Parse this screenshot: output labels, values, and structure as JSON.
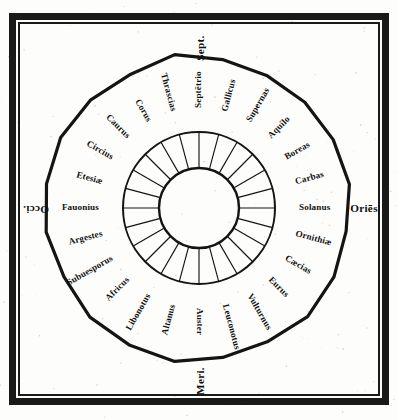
{
  "figure": {
    "ink_color": "#141414",
    "paper_color": "#fdfdfb"
  },
  "cardinals": [
    {
      "label": "Sept.",
      "name": "north",
      "position": "top",
      "rotation": -90
    },
    {
      "label": "Oriēs",
      "name": "east",
      "position": "right",
      "rotation": 0
    },
    {
      "label": "Meri.",
      "name": "south",
      "position": "bottom",
      "rotation": -90
    },
    {
      "label": "Occi.",
      "name": "west",
      "position": "left",
      "rotation": 180
    }
  ],
  "winds": [
    {
      "index": 0,
      "label": "Septētrio",
      "angle": 0
    },
    {
      "index": 1,
      "label": "Gallicus",
      "angle": 15
    },
    {
      "index": 2,
      "label": "Supernas",
      "angle": 30
    },
    {
      "index": 3,
      "label": "Aquilo",
      "angle": 45
    },
    {
      "index": 4,
      "label": "Boreas",
      "angle": 60
    },
    {
      "index": 5,
      "label": "Carbas",
      "angle": 75
    },
    {
      "index": 6,
      "label": "Solanus",
      "angle": 90
    },
    {
      "index": 7,
      "label": "Ornithiæ",
      "angle": 105
    },
    {
      "index": 8,
      "label": "Cæcias",
      "angle": 120
    },
    {
      "index": 9,
      "label": "Eurus",
      "angle": 135
    },
    {
      "index": 10,
      "label": "Vulturnus",
      "angle": 150
    },
    {
      "index": 11,
      "label": "Leuconotus",
      "angle": 165
    },
    {
      "index": 12,
      "label": "Auster",
      "angle": 180
    },
    {
      "index": 13,
      "label": "Altanus",
      "angle": 195
    },
    {
      "index": 14,
      "label": "Libonotus",
      "angle": 210
    },
    {
      "index": 15,
      "label": "Africus",
      "angle": 225
    },
    {
      "index": 16,
      "label": "Subuesporus",
      "angle": 240
    },
    {
      "index": 17,
      "label": "Argestes",
      "angle": 255
    },
    {
      "index": 18,
      "label": "Fauonius",
      "angle": 270
    },
    {
      "index": 19,
      "label": "Etesiæ",
      "angle": 285
    },
    {
      "index": 20,
      "label": "Circius",
      "angle": 300
    },
    {
      "index": 21,
      "label": "Caurus",
      "angle": 315
    },
    {
      "index": 22,
      "label": "Corus",
      "angle": 330
    },
    {
      "index": 23,
      "label": "Thrascias",
      "angle": 345
    }
  ],
  "geometry": {
    "center_x": 199,
    "center_y": 208,
    "polygon_radius": 152,
    "polygon_sides": 20,
    "ring_outer_radius": 76,
    "ring_inner_radius": 40,
    "spoke_count": 24,
    "label_radius": 100
  }
}
